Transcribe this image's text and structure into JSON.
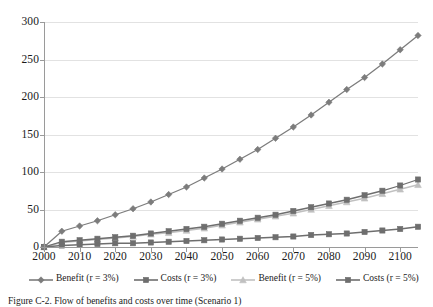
{
  "caption": "Figure C-2. Flow of benefits and costs over time (Scenario 1)",
  "legend": {
    "position": "bottom",
    "entries": [
      {
        "label": "Benefit (r = 3%)",
        "marker": "diamond",
        "color": "#7c7c7c"
      },
      {
        "label": "Costs (r = 3%)",
        "marker": "square",
        "color": "#6e6e6e"
      },
      {
        "label": "Benefit (r = 5%)",
        "marker": "triangle",
        "color": "#c0c0c0"
      },
      {
        "label": "Costs (r = 5%)",
        "marker": "square",
        "color": "#6e6e6e"
      }
    ]
  },
  "chart_data": {
    "type": "line",
    "title": "",
    "xlabel": "",
    "ylabel": "",
    "xlim": [
      2000,
      2105
    ],
    "ylim": [
      0,
      300
    ],
    "yticks": [
      0,
      50,
      100,
      150,
      200,
      250,
      300
    ],
    "xticks": [
      2000,
      2010,
      2020,
      2030,
      2040,
      2050,
      2060,
      2070,
      2080,
      2090,
      2100
    ],
    "grid": true,
    "x": [
      2000,
      2005,
      2010,
      2015,
      2020,
      2025,
      2030,
      2035,
      2040,
      2045,
      2050,
      2055,
      2060,
      2065,
      2070,
      2075,
      2080,
      2085,
      2090,
      2095,
      2100,
      2105
    ],
    "series": [
      {
        "name": "Benefit (r = 3%)",
        "marker": "diamond",
        "color": "#7c7c7c",
        "values": [
          0,
          21,
          28,
          35,
          43,
          51,
          60,
          70,
          80,
          92,
          104,
          117,
          130,
          145,
          160,
          176,
          193,
          210,
          226,
          244,
          263,
          282
        ]
      },
      {
        "name": "Costs (r = 3%)",
        "marker": "square",
        "color": "#6e6e6e",
        "values": [
          0,
          7,
          9,
          11,
          13,
          15,
          18,
          21,
          24,
          27,
          31,
          35,
          39,
          43,
          48,
          53,
          58,
          63,
          69,
          75,
          82,
          90
        ]
      },
      {
        "name": "Benefit (r = 5%)",
        "marker": "triangle",
        "color": "#c0c0c0",
        "values": [
          0,
          6,
          8,
          10,
          12,
          14,
          17,
          19,
          22,
          25,
          29,
          33,
          37,
          41,
          45,
          50,
          55,
          60,
          65,
          71,
          77,
          83
        ]
      },
      {
        "name": "Costs (r = 5%)",
        "marker": "square",
        "color": "#6e6e6e",
        "values": [
          0,
          2,
          3,
          4,
          5,
          5,
          6,
          7,
          8,
          9,
          10,
          11,
          12,
          13,
          14,
          16,
          17,
          18,
          20,
          22,
          24,
          27
        ]
      }
    ]
  }
}
